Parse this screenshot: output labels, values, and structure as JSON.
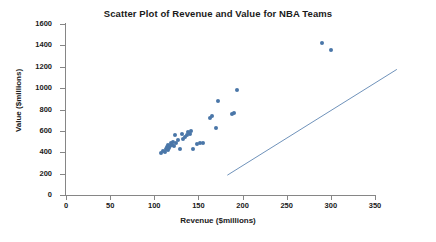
{
  "chart_data": {
    "type": "scatter",
    "title": "Scatter Plot of Revenue and Value for NBA Teams",
    "xlabel": "Revenue ($millions)",
    "ylabel": "Value ($millions)",
    "xlim": [
      0,
      350
    ],
    "ylim": [
      0,
      1600
    ],
    "xticks": [
      0,
      50,
      100,
      150,
      200,
      250,
      300,
      350
    ],
    "yticks": [
      0,
      200,
      400,
      600,
      800,
      1000,
      1200,
      1400,
      1600
    ],
    "grid": false,
    "legend": false,
    "marker_color": "#4a76a8",
    "trendline_color": "#4a76a8",
    "trendline": {
      "x_start": 108,
      "y_start": 410,
      "x_end": 300,
      "y_end": 1400
    },
    "points": [
      {
        "x": 108,
        "y": 395
      },
      {
        "x": 110,
        "y": 410
      },
      {
        "x": 112,
        "y": 400
      },
      {
        "x": 113,
        "y": 430
      },
      {
        "x": 114,
        "y": 450
      },
      {
        "x": 115,
        "y": 420
      },
      {
        "x": 116,
        "y": 470
      },
      {
        "x": 117,
        "y": 440
      },
      {
        "x": 118,
        "y": 455
      },
      {
        "x": 119,
        "y": 485
      },
      {
        "x": 120,
        "y": 470
      },
      {
        "x": 121,
        "y": 500
      },
      {
        "x": 122,
        "y": 455
      },
      {
        "x": 124,
        "y": 560
      },
      {
        "x": 125,
        "y": 490
      },
      {
        "x": 127,
        "y": 510
      },
      {
        "x": 129,
        "y": 430
      },
      {
        "x": 131,
        "y": 575
      },
      {
        "x": 133,
        "y": 520
      },
      {
        "x": 135,
        "y": 545
      },
      {
        "x": 137,
        "y": 560
      },
      {
        "x": 138,
        "y": 585
      },
      {
        "x": 140,
        "y": 570
      },
      {
        "x": 142,
        "y": 600
      },
      {
        "x": 144,
        "y": 430
      },
      {
        "x": 148,
        "y": 480
      },
      {
        "x": 152,
        "y": 485
      },
      {
        "x": 155,
        "y": 490
      },
      {
        "x": 163,
        "y": 720
      },
      {
        "x": 165,
        "y": 740
      },
      {
        "x": 170,
        "y": 630
      },
      {
        "x": 172,
        "y": 880
      },
      {
        "x": 188,
        "y": 755
      },
      {
        "x": 190,
        "y": 770
      },
      {
        "x": 194,
        "y": 985
      },
      {
        "x": 290,
        "y": 1420
      },
      {
        "x": 300,
        "y": 1355
      }
    ]
  }
}
